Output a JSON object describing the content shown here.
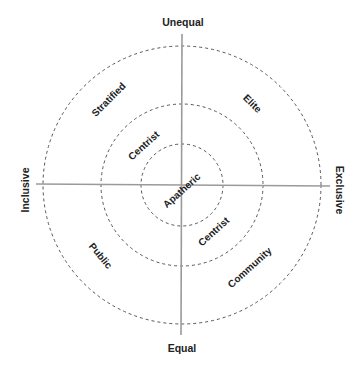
{
  "diagram": {
    "type": "concentric-quadrant-diagram",
    "center": {
      "x": 182,
      "y": 185
    },
    "rings": [
      {
        "name": "inner",
        "radius": 41
      },
      {
        "name": "middle",
        "radius": 81
      },
      {
        "name": "outer",
        "radius": 139
      }
    ],
    "colors": {
      "axis": "#9a9a9a",
      "ring": "#555555",
      "text": "#222222"
    },
    "axes": {
      "top": "Unequal",
      "bottom": "Equal",
      "left": "Inclusive",
      "right": "Exclusive"
    },
    "zones": {
      "stratified": "Stratified",
      "elite": "Elite",
      "centrist_upper": "Centrist",
      "apatheric": "Apatheric",
      "centrist_lower": "Centrist",
      "public": "Public",
      "community": "Community"
    }
  }
}
